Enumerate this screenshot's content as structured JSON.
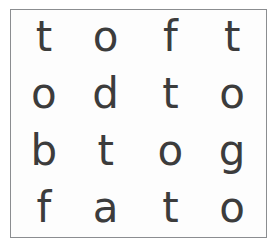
{
  "worksheet": {
    "title": "letter-recognition-grid",
    "background_color": "#ffffff",
    "panel_background_color": "#fdfdfd",
    "border_color": "#8b8d90",
    "glyph_color": "#3c3c3c",
    "rows": 4,
    "columns": 4,
    "grid": [
      {
        "cells": [
          {
            "letter": "t"
          },
          {
            "letter": "o"
          },
          {
            "letter": "f"
          },
          {
            "letter": "t"
          }
        ]
      },
      {
        "cells": [
          {
            "letter": "o"
          },
          {
            "letter": "d"
          },
          {
            "letter": "t"
          },
          {
            "letter": "o"
          }
        ]
      },
      {
        "cells": [
          {
            "letter": "b"
          },
          {
            "letter": "t"
          },
          {
            "letter": "o"
          },
          {
            "letter": "g"
          }
        ]
      },
      {
        "cells": [
          {
            "letter": "f"
          },
          {
            "letter": "a"
          },
          {
            "letter": "t"
          },
          {
            "letter": "o"
          }
        ]
      }
    ]
  }
}
